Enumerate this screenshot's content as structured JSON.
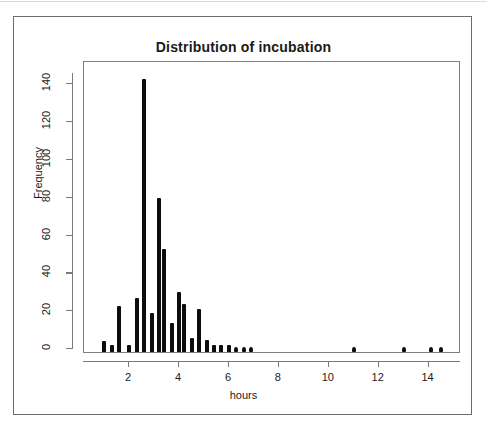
{
  "figure": {
    "title": "Distribution of incubation",
    "x_axis_title": "hours",
    "y_axis_title": "Frequency"
  },
  "chart_data": {
    "type": "bar",
    "title": "Distribution of incubation",
    "subtitle": "",
    "xlabel": "hours",
    "ylabel": "Frequency",
    "xlim": [
      0.75,
      14.9
    ],
    "ylim": [
      0,
      147
    ],
    "grid": false,
    "legend": null,
    "x_ticks": [
      2,
      4,
      6,
      8,
      10,
      12,
      14
    ],
    "y_ticks": [
      0,
      20,
      40,
      60,
      80,
      100,
      120,
      140
    ],
    "x": [
      1.0,
      1.3,
      1.6,
      2.0,
      2.3,
      2.6,
      2.9,
      3.2,
      3.4,
      3.7,
      4.0,
      4.2,
      4.5,
      4.8,
      5.1,
      5.4,
      5.7,
      6.0,
      6.3,
      6.6,
      6.9,
      11.0,
      13.0,
      14.1,
      14.5
    ],
    "values": [
      4,
      2,
      23,
      2,
      27,
      143,
      19,
      80,
      53,
      14,
      30,
      24,
      6,
      21,
      5,
      2,
      2,
      2,
      1,
      1,
      1,
      1,
      1,
      1,
      1
    ],
    "series": [
      {
        "name": "incubation frequency",
        "values": [
          4,
          2,
          23,
          2,
          27,
          143,
          19,
          80,
          53,
          14,
          30,
          24,
          6,
          21,
          5,
          2,
          2,
          2,
          1,
          1,
          1,
          1,
          1,
          1,
          1
        ]
      }
    ],
    "points": [
      {
        "hours": 1.0,
        "frequency": 4
      },
      {
        "hours": 1.3,
        "frequency": 2
      },
      {
        "hours": 1.6,
        "frequency": 23
      },
      {
        "hours": 2.0,
        "frequency": 2
      },
      {
        "hours": 2.3,
        "frequency": 27
      },
      {
        "hours": 2.6,
        "frequency": 143
      },
      {
        "hours": 2.9,
        "frequency": 19
      },
      {
        "hours": 3.2,
        "frequency": 80
      },
      {
        "hours": 3.4,
        "frequency": 53
      },
      {
        "hours": 3.7,
        "frequency": 14
      },
      {
        "hours": 4.0,
        "frequency": 30
      },
      {
        "hours": 4.2,
        "frequency": 24
      },
      {
        "hours": 4.5,
        "frequency": 6
      },
      {
        "hours": 4.8,
        "frequency": 21
      },
      {
        "hours": 5.1,
        "frequency": 5
      },
      {
        "hours": 5.4,
        "frequency": 2
      },
      {
        "hours": 5.7,
        "frequency": 2
      },
      {
        "hours": 6.0,
        "frequency": 2
      },
      {
        "hours": 6.3,
        "frequency": 1
      },
      {
        "hours": 6.6,
        "frequency": 1
      },
      {
        "hours": 6.9,
        "frequency": 1
      },
      {
        "hours": 11.0,
        "frequency": 1
      },
      {
        "hours": 13.0,
        "frequency": 1
      },
      {
        "hours": 14.1,
        "frequency": 1
      },
      {
        "hours": 14.5,
        "frequency": 1
      }
    ],
    "colors": {
      "marker": "#0d0d0d",
      "axis": "#7a7a7a",
      "frame": "#6d6d6d",
      "text": "#1a1a1a",
      "background": "#ffffff"
    }
  }
}
